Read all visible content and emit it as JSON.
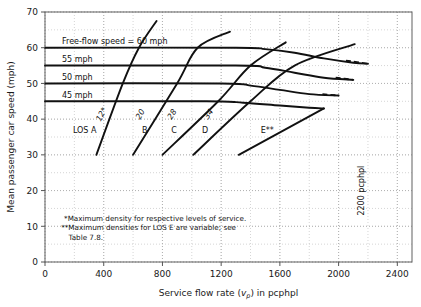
{
  "chart_data": {
    "type": "line",
    "title": "",
    "xlabel": "Service flow rate (vp) in pcphpl",
    "xlabel_main": "Service flow rate (",
    "xlabel_var": "v",
    "xlabel_sub": "p",
    "xlabel_tail": ") in pcphpl",
    "ylabel": "Mean passenger car speed (mph)",
    "xlim": [
      0,
      2500
    ],
    "ylim": [
      0,
      70
    ],
    "xticks": [
      0,
      400,
      800,
      1200,
      1600,
      2000,
      2400
    ],
    "yticks": [
      0,
      10,
      20,
      30,
      40,
      50,
      60,
      70
    ],
    "xtick_labels": [
      "0",
      "400",
      "800",
      "1200",
      "1600",
      "2000",
      "2400"
    ],
    "ytick_labels": [
      "0",
      "10",
      "20",
      "30",
      "40",
      "50",
      "60",
      "70"
    ],
    "grid": "dotted major and minor gridlines",
    "minor_x_step": 200,
    "minor_y_step": 5,
    "legend": "none",
    "series": [
      {
        "name": "Free-flow speed = 60 mph",
        "label": "Free-flow speed = 60 mph",
        "free_flow_speed": 60,
        "points": [
          [
            0,
            60
          ],
          [
            1300,
            60
          ],
          [
            1500,
            59.6
          ],
          [
            1700,
            58.6
          ],
          [
            1900,
            57.0
          ],
          [
            2100,
            55.8
          ],
          [
            2200,
            55.5
          ]
        ],
        "dashed_tail": [
          [
            2050,
            56.4
          ],
          [
            2200,
            55.5
          ]
        ]
      },
      {
        "name": "55 mph",
        "label": "55 mph",
        "free_flow_speed": 55,
        "points": [
          [
            0,
            55
          ],
          [
            1300,
            55
          ],
          [
            1500,
            54.4
          ],
          [
            1700,
            53.0
          ],
          [
            1900,
            51.6
          ],
          [
            2100,
            51.0
          ]
        ],
        "dashed_tail": [
          [
            1980,
            51.6
          ],
          [
            2100,
            51.0
          ]
        ]
      },
      {
        "name": "50 mph",
        "label": "50 mph",
        "free_flow_speed": 50,
        "points": [
          [
            0,
            50
          ],
          [
            1200,
            50
          ],
          [
            1400,
            49.4
          ],
          [
            1600,
            48.2
          ],
          [
            1800,
            47.0
          ],
          [
            2000,
            46.6
          ]
        ],
        "dashed_tail": [
          [
            1890,
            47.0
          ],
          [
            2000,
            46.6
          ]
        ]
      },
      {
        "name": "45 mph",
        "label": "45 mph",
        "free_flow_speed": 45,
        "points": [
          [
            0,
            45
          ],
          [
            1100,
            45
          ],
          [
            1350,
            44.6
          ],
          [
            1600,
            43.8
          ],
          [
            1800,
            43.2
          ],
          [
            1900,
            43.0
          ]
        ]
      }
    ],
    "los_boundaries": [
      {
        "name": "LOS A boundary",
        "density_label": "12*",
        "density": 12,
        "points": [
          [
            350,
            30
          ],
          [
            530,
            50
          ],
          [
            640,
            60
          ],
          [
            760,
            67.5
          ]
        ]
      },
      {
        "name": "LOS B boundary",
        "density_label": "20",
        "density": 20,
        "points": [
          [
            600,
            30
          ],
          [
            900,
            50
          ],
          [
            1040,
            60
          ],
          [
            1260,
            64.5
          ]
        ]
      },
      {
        "name": "LOS C boundary",
        "density_label": "28",
        "density": 28,
        "points": [
          [
            800,
            30
          ],
          [
            1180,
            45
          ],
          [
            1400,
            55
          ],
          [
            1640,
            61.5
          ]
        ]
      },
      {
        "name": "LOS D boundary",
        "density_label": "34",
        "density": 34,
        "points": [
          [
            1010,
            30
          ],
          [
            1400,
            45
          ],
          [
            1700,
            55
          ],
          [
            2110,
            61
          ]
        ]
      },
      {
        "name": "LOS E boundary",
        "density_label": "",
        "density": null,
        "points": [
          [
            1320,
            30
          ],
          [
            1900,
            43
          ]
        ]
      }
    ],
    "los_labels": [
      {
        "text": "LOS A",
        "x": 190,
        "y": 36
      },
      {
        "text": "B",
        "x": 660,
        "y": 36
      },
      {
        "text": "C",
        "x": 860,
        "y": 36
      },
      {
        "text": "D",
        "x": 1070,
        "y": 36
      },
      {
        "text": "E**",
        "x": 1470,
        "y": 36
      }
    ],
    "capacity_annotation": {
      "text": "2200 pcphpl",
      "flow": 2200,
      "orientation": "vertical"
    },
    "notes": [
      "*Maximum density for respective levels of service.",
      "**Maximum densities for LOS E are variable; see",
      "Table 7.8."
    ]
  },
  "colors": {
    "curve": "#111111",
    "grid": "#b9b9b9",
    "axis": "#555555",
    "text": "#1a1a1a",
    "background": "#ffffff"
  }
}
